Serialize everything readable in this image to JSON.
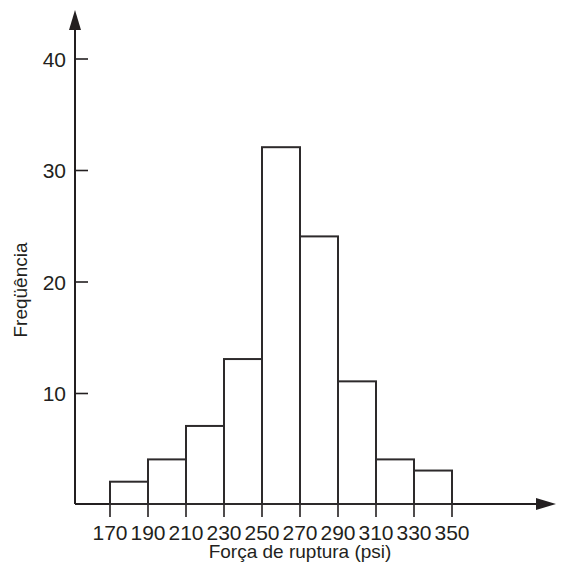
{
  "chart_data": {
    "type": "bar",
    "title": "",
    "subtitle": "",
    "xlabel": "Força de ruptura (psi)",
    "ylabel": "Freqüência",
    "categories": [
      "170-190",
      "190-210",
      "210-230",
      "230-250",
      "250-270",
      "270-290",
      "290-310",
      "310-330",
      "330-350"
    ],
    "bin_edges": [
      170,
      190,
      210,
      230,
      250,
      270,
      290,
      310,
      330,
      350
    ],
    "values": [
      2,
      4,
      7,
      13,
      32,
      24,
      11,
      4,
      3
    ],
    "x_tick_labels": [
      "170",
      "190",
      "210",
      "230",
      "250",
      "270",
      "290",
      "310",
      "330",
      "350"
    ],
    "y_tick_labels": [
      "10",
      "20",
      "30",
      "40"
    ],
    "y_tick_values": [
      10,
      20,
      30,
      40
    ],
    "xlim": [
      170,
      350
    ],
    "ylim": [
      0,
      44
    ],
    "grid": false,
    "legend": null,
    "bar_fill_color": "#ffffff",
    "bar_edge_color": "#2d2a2b",
    "axis_color": "#231f20",
    "background_color": "#ffffff",
    "annotations": []
  }
}
